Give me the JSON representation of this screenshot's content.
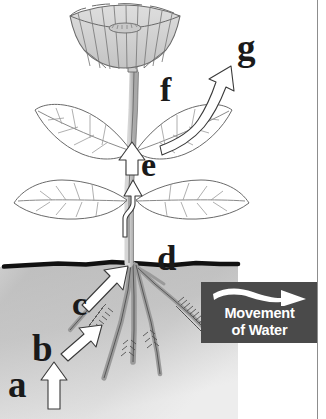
{
  "figure": {
    "type": "labeled-biology-diagram",
    "background_color": "#ffffff"
  },
  "labels": [
    {
      "id": "a",
      "text": "a",
      "location": "soil water outside root, lower left"
    },
    {
      "id": "b",
      "text": "b",
      "location": "root hair in soil"
    },
    {
      "id": "c",
      "text": "c",
      "location": "root interior, water rising"
    },
    {
      "id": "d",
      "text": "d",
      "location": "stem at soil line"
    },
    {
      "id": "e",
      "text": "e",
      "location": "stem between leaf nodes"
    },
    {
      "id": "f",
      "text": "f",
      "location": "upper leaf / flower stalk"
    },
    {
      "id": "g",
      "text": "g",
      "location": "water vapor leaving leaf, upper right"
    }
  ],
  "legend": {
    "arrow_icon": "curved-right-arrow-icon",
    "line1": "Movement",
    "line2": "of Water",
    "background_color": "#4a4a4a",
    "text_color": "#ffffff"
  },
  "plant": {
    "flower": "cup-shaped bloom with radiating petal lines",
    "leaf_pairs": 2,
    "roots": "branching taproot with fine root hairs",
    "soil_line_color": "#1a1a1a",
    "soil_fill": "gray gradient",
    "arrow_style": "white outlined arrows"
  }
}
